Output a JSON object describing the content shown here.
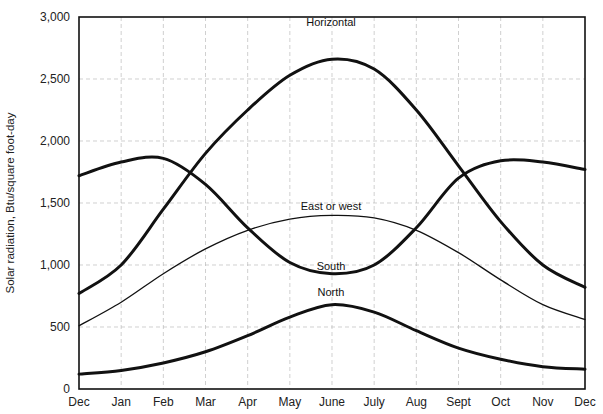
{
  "chart_data": {
    "type": "line",
    "title": "",
    "xlabel": "",
    "ylabel": "Solar radiation, Btu/square foot-day",
    "categories": [
      "Dec",
      "Jan",
      "Feb",
      "Mar",
      "Apr",
      "May",
      "June",
      "July",
      "Aug",
      "Sept",
      "Oct",
      "Nov",
      "Dec"
    ],
    "ylim": [
      0,
      3000
    ],
    "yticks": [
      0,
      500,
      1000,
      1500,
      2000,
      2500,
      3000
    ],
    "ytick_labels": [
      "0",
      "500",
      "1,000",
      "1,500",
      "2,000",
      "2,500",
      "3,000"
    ],
    "grid": true,
    "legend": "inline labels",
    "series": [
      {
        "name": "Horizontal",
        "values": [
          770,
          1000,
          1450,
          1900,
          2250,
          2530,
          2660,
          2580,
          2250,
          1800,
          1350,
          1000,
          820
        ],
        "weight": "thick"
      },
      {
        "name": "South",
        "values": [
          1720,
          1830,
          1860,
          1650,
          1300,
          1020,
          930,
          1000,
          1300,
          1700,
          1840,
          1830,
          1770
        ],
        "weight": "thick"
      },
      {
        "name": "East or west",
        "values": [
          510,
          700,
          930,
          1130,
          1280,
          1370,
          1400,
          1380,
          1280,
          1100,
          880,
          680,
          560
        ],
        "weight": "thin"
      },
      {
        "name": "North",
        "values": [
          120,
          150,
          210,
          300,
          430,
          580,
          680,
          620,
          470,
          330,
          240,
          180,
          160
        ],
        "weight": "thick"
      }
    ]
  }
}
